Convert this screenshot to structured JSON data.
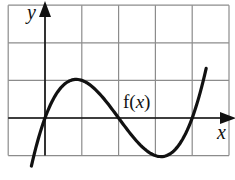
{
  "chart_data": {
    "type": "line",
    "title": "",
    "xlabel": "x",
    "ylabel": "y",
    "annotation": "f(x)",
    "function": "f(x) = (1/3)·x(x−2)(x−4)",
    "xlim": [
      -1,
      5
    ],
    "ylim": [
      -1,
      3
    ],
    "grid": true,
    "legend": "none",
    "grid_cell": 1,
    "key_points": [
      {
        "x": 0,
        "y": 0,
        "kind": "root"
      },
      {
        "x": 1,
        "y": 1,
        "kind": "local max"
      },
      {
        "x": 2,
        "y": 0,
        "kind": "root"
      },
      {
        "x": 3,
        "y": -1,
        "kind": "local min"
      },
      {
        "x": 4,
        "y": 0,
        "kind": "root"
      }
    ],
    "series": [
      {
        "name": "f(x)",
        "x": [
          -0.37,
          0,
          0.5,
          1,
          1.5,
          2,
          2.5,
          3,
          3.5,
          4,
          4.38
        ],
        "y": [
          -1.14,
          0,
          0.875,
          1,
          0.625,
          0,
          -0.625,
          -1,
          -0.875,
          0,
          1.22
        ]
      }
    ],
    "x_range_drawn": [
      -0.37,
      4.38
    ],
    "colors": {
      "curve": "#111111",
      "grid": "#8c8c8c",
      "axes": "#111111"
    }
  }
}
